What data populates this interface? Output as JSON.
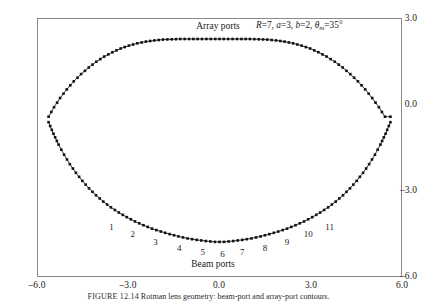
{
  "figure": {
    "caption_label": "FIGURE 12.14",
    "caption_text": "Rotman lens geometry: beam-port and array-port contours."
  },
  "annotation": {
    "R_name": "R",
    "R_value": "7",
    "a_name": "a",
    "a_value": "3",
    "b_name": "b",
    "b_value": "2",
    "theta_name": "θ",
    "theta_sub": "m",
    "theta_value": "35°",
    "sep": ", ",
    "eq": "="
  },
  "labels": {
    "array_ports": "Array ports",
    "beam_ports": "Beam ports"
  },
  "axes": {
    "x_ticks": [
      "–6.0",
      "–3.0",
      "0.0",
      "3.0",
      "6.0"
    ],
    "y_ticks": [
      "3.0",
      "0.0",
      "–3.0",
      "–6.0"
    ],
    "xlim": [
      -6.0,
      6.0
    ],
    "ylim": [
      -6.0,
      3.0
    ],
    "xlabel": "",
    "ylabel": ""
  },
  "beam_port_numbers": [
    "1",
    "2",
    "3",
    "4",
    "5",
    "6",
    "7",
    "8",
    "9",
    "10",
    "11"
  ],
  "colors": {
    "marker": "#111111",
    "line": "#222222",
    "frame": "#8a8a8a",
    "text": "#1a1a1a"
  },
  "chart_data": {
    "type": "scatter",
    "title": "",
    "xlabel": "",
    "ylabel": "",
    "xlim": [
      -6.0,
      6.0
    ],
    "ylim": [
      -6.0,
      3.0
    ],
    "grid": false,
    "legend": "none",
    "annotations": [
      {
        "text": "Array ports",
        "x": 0.0,
        "y": 2.75
      },
      {
        "text": "Beam ports",
        "x": 0.0,
        "y": -5.52
      },
      {
        "text": "R=7, a=3, b=2, θm=35°",
        "x": 3.6,
        "y": 2.78
      }
    ],
    "series": [
      {
        "name": "Array ports contour",
        "marker": "square",
        "x": [
          -5.62,
          -5.44,
          -5.24,
          -5.02,
          -4.79,
          -4.55,
          -4.3,
          -4.05,
          -3.79,
          -3.52,
          -3.25,
          -2.98,
          -2.7,
          -2.42,
          -2.14,
          -1.86,
          -1.57,
          -1.29,
          -1.0,
          -0.72,
          -0.43,
          -0.14,
          0.14,
          0.43,
          0.72,
          1.0,
          1.29,
          1.57,
          1.86,
          2.14,
          2.42,
          2.7,
          2.98,
          3.25,
          3.52,
          3.79,
          4.05,
          4.3,
          4.55,
          4.79,
          5.02,
          5.24,
          5.44,
          5.62
        ],
        "y": [
          -0.43,
          -0.1,
          0.22,
          0.52,
          0.8,
          1.05,
          1.28,
          1.48,
          1.66,
          1.81,
          1.94,
          2.04,
          2.12,
          2.18,
          2.22,
          2.25,
          2.26,
          2.27,
          2.27,
          2.27,
          2.27,
          2.27,
          2.27,
          2.27,
          2.27,
          2.27,
          2.26,
          2.25,
          2.22,
          2.18,
          2.12,
          2.04,
          1.94,
          1.81,
          1.66,
          1.48,
          1.28,
          1.05,
          0.8,
          0.52,
          0.22,
          -0.1,
          -0.43,
          -0.43
        ]
      },
      {
        "name": "Beam ports contour",
        "marker": "square",
        "x": [
          -5.62,
          -5.46,
          -5.29,
          -5.11,
          -4.92,
          -4.72,
          -4.51,
          -4.29,
          -4.06,
          -3.82,
          -3.57,
          -3.31,
          -3.05,
          -2.78,
          -2.5,
          -2.22,
          -1.93,
          -1.64,
          -1.35,
          -1.05,
          -0.75,
          -0.45,
          -0.15,
          0.15,
          0.45,
          0.75,
          1.05,
          1.35,
          1.64,
          1.93,
          2.22,
          2.5,
          2.78,
          3.05,
          3.31,
          3.57,
          3.82,
          4.06,
          4.29,
          4.51,
          4.72,
          4.92,
          5.11,
          5.29,
          5.46,
          5.62
        ],
        "y": [
          -0.62,
          -1.02,
          -1.4,
          -1.75,
          -2.08,
          -2.38,
          -2.66,
          -2.92,
          -3.16,
          -3.38,
          -3.58,
          -3.76,
          -3.92,
          -4.07,
          -4.2,
          -4.32,
          -4.42,
          -4.51,
          -4.59,
          -4.66,
          -4.71,
          -4.75,
          -4.78,
          -4.78,
          -4.75,
          -4.71,
          -4.66,
          -4.59,
          -4.51,
          -4.42,
          -4.32,
          -4.2,
          -4.07,
          -3.92,
          -3.76,
          -3.58,
          -3.38,
          -3.16,
          -2.92,
          -2.66,
          -2.38,
          -2.08,
          -1.75,
          -1.4,
          -1.02,
          -0.62
        ]
      }
    ],
    "beam_port_markers": {
      "name": "Numbered beam ports",
      "labels": [
        "1",
        "2",
        "3",
        "4",
        "5",
        "6",
        "7",
        "8",
        "9",
        "10",
        "11"
      ],
      "x": [
        -3.55,
        -2.85,
        -2.1,
        -1.32,
        -0.55,
        0.1,
        0.75,
        1.5,
        2.22,
        2.92,
        3.62
      ],
      "y": [
        -4.25,
        -4.52,
        -4.78,
        -5.0,
        -5.12,
        -5.2,
        -5.12,
        -5.0,
        -4.78,
        -4.52,
        -4.25
      ]
    }
  }
}
